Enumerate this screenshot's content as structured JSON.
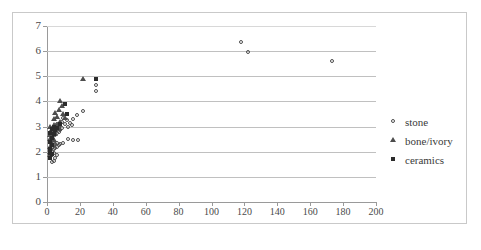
{
  "chart_data": {
    "type": "scatter",
    "title": "",
    "xlabel": "",
    "ylabel": "",
    "xlim": [
      0,
      200
    ],
    "ylim": [
      0,
      7
    ],
    "x_ticks": [
      0,
      20,
      40,
      60,
      80,
      100,
      120,
      140,
      160,
      180,
      200
    ],
    "y_ticks": [
      0,
      1,
      2,
      3,
      4,
      5,
      6,
      7
    ],
    "grid": "horizontal",
    "legend_position": "right",
    "series": [
      {
        "name": "stone",
        "marker": "open-circle",
        "color": "#4d4d4d",
        "points": [
          [
            118,
            6.35
          ],
          [
            122,
            5.95
          ],
          [
            173,
            5.6
          ],
          [
            30,
            4.65
          ],
          [
            30,
            4.4
          ],
          [
            22,
            3.6
          ],
          [
            18,
            3.45
          ],
          [
            16,
            3.3
          ],
          [
            14,
            3.15
          ],
          [
            15,
            3.05
          ],
          [
            13,
            3.0
          ],
          [
            12,
            3.25
          ],
          [
            11,
            3.1
          ],
          [
            10,
            3.35
          ],
          [
            9,
            3.2
          ],
          [
            9,
            2.95
          ],
          [
            8,
            3.05
          ],
          [
            8,
            2.85
          ],
          [
            7,
            3.0
          ],
          [
            7,
            2.8
          ],
          [
            6,
            2.9
          ],
          [
            6,
            2.75
          ],
          [
            6,
            3.1
          ],
          [
            5,
            2.95
          ],
          [
            5,
            2.8
          ],
          [
            5,
            2.65
          ],
          [
            4,
            2.85
          ],
          [
            4,
            2.7
          ],
          [
            4,
            3.0
          ],
          [
            16,
            2.45
          ],
          [
            19,
            2.45
          ],
          [
            13,
            2.5
          ],
          [
            10,
            2.35
          ],
          [
            8,
            2.3
          ],
          [
            7,
            2.25
          ],
          [
            6,
            2.2
          ],
          [
            6,
            2.35
          ],
          [
            5,
            2.15
          ],
          [
            5,
            2.3
          ],
          [
            4,
            2.1
          ],
          [
            4,
            2.25
          ],
          [
            4,
            1.95
          ],
          [
            3,
            2.15
          ],
          [
            3,
            2.0
          ],
          [
            3,
            1.85
          ],
          [
            3,
            2.3
          ],
          [
            2,
            2.05
          ],
          [
            2,
            1.9
          ],
          [
            5,
            1.75
          ],
          [
            4,
            1.65
          ],
          [
            3,
            1.6
          ],
          [
            6,
            1.85
          ]
        ]
      },
      {
        "name": "bone/ivory",
        "marker": "open-triangle",
        "color": "#4d4d4d",
        "points": [
          [
            22,
            4.9
          ],
          [
            8,
            4.0
          ],
          [
            9,
            3.8
          ],
          [
            7,
            3.65
          ],
          [
            5,
            3.55
          ],
          [
            6,
            3.4
          ],
          [
            4,
            3.3
          ],
          [
            10,
            3.5
          ],
          [
            11,
            3.35
          ],
          [
            8,
            3.2
          ],
          [
            6,
            3.05
          ],
          [
            5,
            2.95
          ],
          [
            7,
            2.9
          ],
          [
            4,
            2.8
          ],
          [
            5,
            2.7
          ],
          [
            3,
            2.9
          ],
          [
            3,
            2.6
          ],
          [
            2,
            2.5
          ],
          [
            4,
            2.45
          ],
          [
            3,
            2.35
          ],
          [
            2,
            2.2
          ],
          [
            2,
            2.0
          ],
          [
            2,
            1.85
          ],
          [
            3,
            2.75
          ],
          [
            4,
            3.05
          ],
          [
            2,
            2.65
          ],
          [
            2,
            3.0
          ]
        ]
      },
      {
        "name": "ceramics",
        "marker": "filled-square",
        "color": "#2b2b2b",
        "points": [
          [
            30,
            4.9
          ],
          [
            11,
            3.9
          ],
          [
            12,
            3.5
          ],
          [
            8,
            3.1
          ],
          [
            6,
            2.95
          ],
          [
            5,
            2.85
          ],
          [
            4,
            2.7
          ],
          [
            3,
            2.55
          ],
          [
            3,
            2.25
          ],
          [
            2,
            2.1
          ],
          [
            2,
            1.95
          ],
          [
            2,
            2.4
          ],
          [
            3,
            2.9
          ],
          [
            4,
            3.0
          ],
          [
            2,
            2.75
          ],
          [
            2,
            1.75
          ],
          [
            3,
            1.9
          ]
        ]
      }
    ]
  },
  "legend": {
    "entries": [
      {
        "label": "stone"
      },
      {
        "label": "bone/ivory"
      },
      {
        "label": "ceramics"
      }
    ]
  }
}
